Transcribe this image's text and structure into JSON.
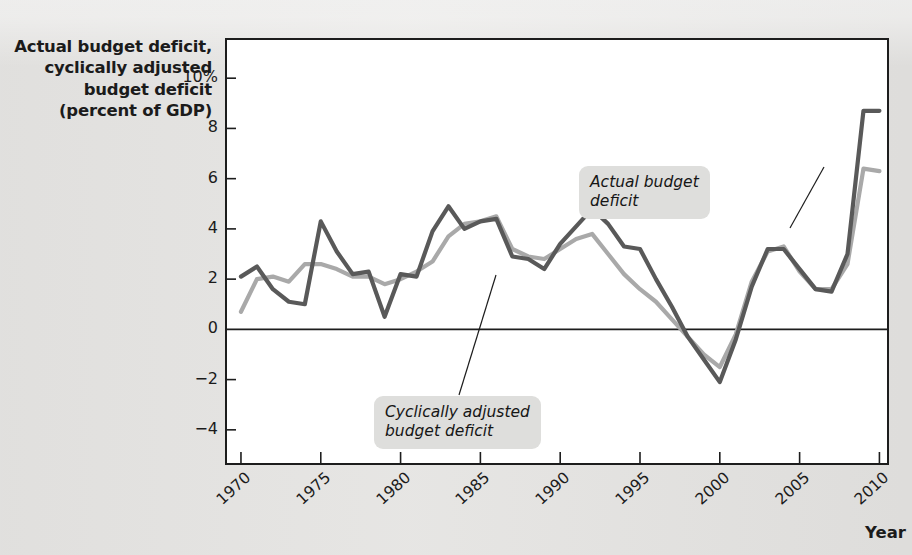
{
  "figure": {
    "y_axis_title_lines": [
      "Actual budget deficit,",
      "cyclically adjusted",
      "budget deficit",
      "(percent of GDP)"
    ],
    "x_axis_title": "Year",
    "callouts": {
      "actual": "Actual budget\ndeficit",
      "cyclical": "Cyclically adjusted\nbudget deficit"
    },
    "colors": {
      "actual_line": "#595959",
      "cyclical_line": "#a9a9a9",
      "frame": "#1d1d1d",
      "zero_line": "#1d1d1d",
      "plot_background": "#ffffff",
      "page_background": "#e5e4e2",
      "callout_background": "#dededc"
    }
  },
  "chart_data": {
    "type": "line",
    "title": "",
    "xlabel": "Year",
    "ylabel": "Actual budget deficit, cyclically adjusted budget deficit (percent of GDP)",
    "xlim": [
      1969,
      2010.6
    ],
    "ylim": [
      -5.4,
      11.6
    ],
    "xticks": [
      1970,
      1975,
      1980,
      1985,
      1990,
      1995,
      2000,
      2005,
      2010
    ],
    "xtick_labels": [
      "1970",
      "1975",
      "1980",
      "1985",
      "1990",
      "1995",
      "2000",
      "2005",
      "2010"
    ],
    "yticks": [
      -4,
      -2,
      0,
      2,
      4,
      6,
      8,
      10
    ],
    "ytick_labels": [
      "−4",
      "−2",
      "0",
      "2",
      "4",
      "6",
      "8",
      "10%"
    ],
    "grid": false,
    "zero_line": 0,
    "legend": "annotations",
    "x": [
      1970,
      1971,
      1972,
      1973,
      1974,
      1975,
      1976,
      1977,
      1978,
      1979,
      1980,
      1981,
      1982,
      1983,
      1984,
      1985,
      1986,
      1987,
      1988,
      1989,
      1990,
      1991,
      1992,
      1993,
      1994,
      1995,
      1996,
      1997,
      1998,
      1999,
      2000,
      2001,
      2002,
      2003,
      2004,
      2005,
      2006,
      2007,
      2008,
      2009,
      2010
    ],
    "series": [
      {
        "name": "Actual budget deficit",
        "color": "#595959",
        "values": [
          2.1,
          2.5,
          1.6,
          1.1,
          1.0,
          4.3,
          3.1,
          2.2,
          2.3,
          0.5,
          2.2,
          2.1,
          3.9,
          4.9,
          4.0,
          4.3,
          4.4,
          2.9,
          2.8,
          2.4,
          3.4,
          4.1,
          4.8,
          4.2,
          3.3,
          3.2,
          2.0,
          0.9,
          -0.3,
          -1.2,
          -2.1,
          -0.4,
          1.7,
          3.2,
          3.2,
          2.4,
          1.6,
          1.5,
          3.0,
          8.7,
          8.7
        ]
      },
      {
        "name": "Cyclically adjusted budget deficit",
        "color": "#a9a9a9",
        "values": [
          0.7,
          2.0,
          2.1,
          1.9,
          2.6,
          2.6,
          2.4,
          2.1,
          2.1,
          1.8,
          2.0,
          2.3,
          2.7,
          3.7,
          4.2,
          4.3,
          4.5,
          3.2,
          2.9,
          2.8,
          3.2,
          3.6,
          3.8,
          3.0,
          2.2,
          1.6,
          1.1,
          0.4,
          -0.3,
          -1.0,
          -1.5,
          -0.2,
          1.9,
          3.1,
          3.3,
          2.3,
          1.6,
          1.6,
          2.6,
          6.4,
          6.3
        ]
      }
    ]
  }
}
